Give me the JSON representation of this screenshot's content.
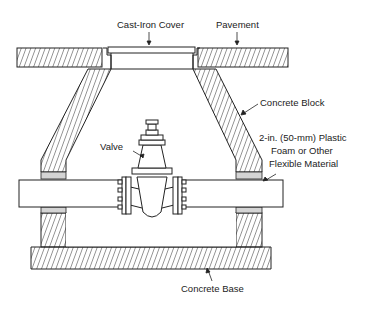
{
  "diagram": {
    "type": "cross-section",
    "labels": {
      "cover": "Cast-Iron Cover",
      "pavement": "Pavement",
      "block": "Concrete Block",
      "foam_line1": "2-in. (50-mm) Plastic",
      "foam_line2": "Foam or Other",
      "foam_line3": "Flexible Material",
      "valve": "Valve",
      "base": "Concrete Base"
    },
    "colors": {
      "line": "#222222",
      "foam": "#d4d4d4",
      "background": "#ffffff"
    }
  }
}
